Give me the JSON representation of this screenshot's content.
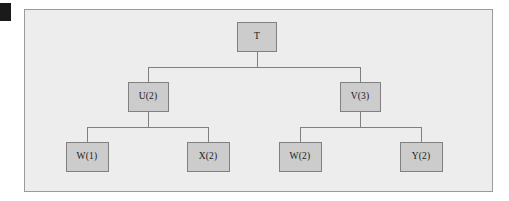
{
  "figure": {
    "name": "tree-diagram",
    "background_color": "#ffffff",
    "panel": {
      "fill_color": "#ededed",
      "border_color": "#9a9a9a",
      "x": 24,
      "y": 9,
      "width": 469,
      "height": 183
    },
    "scan_mark": {
      "color": "#1a1a1a",
      "x": 0,
      "y": 3,
      "width": 11,
      "height": 18
    },
    "node_style": {
      "fill_color": "#cccccc",
      "border_color": "#808080",
      "text_color": "#1a1a1a"
    },
    "edge_style": {
      "color": "#808080",
      "width": 1
    }
  },
  "chart_data": {
    "type": "diagram",
    "diagram_kind": "tree",
    "title": "",
    "orientation": "top-down",
    "levels": 3,
    "nodes": [
      {
        "id": "T",
        "label": "T",
        "level": 0,
        "cx": 257,
        "cy": 37,
        "w": 40,
        "h": 30,
        "parent": null
      },
      {
        "id": "U",
        "label": "U(2)",
        "level": 1,
        "cx": 148,
        "cy": 97,
        "w": 41,
        "h": 30,
        "parent": "T"
      },
      {
        "id": "V",
        "label": "V(3)",
        "level": 1,
        "cx": 360,
        "cy": 97,
        "w": 41,
        "h": 30,
        "parent": "T"
      },
      {
        "id": "W1",
        "label": "W(1)",
        "level": 2,
        "cx": 87,
        "cy": 157,
        "w": 43,
        "h": 30,
        "parent": "U"
      },
      {
        "id": "X2",
        "label": "X(2)",
        "level": 2,
        "cx": 208,
        "cy": 157,
        "w": 43,
        "h": 30,
        "parent": "U"
      },
      {
        "id": "W2",
        "label": "W(2)",
        "level": 2,
        "cx": 300,
        "cy": 157,
        "w": 43,
        "h": 30,
        "parent": "V"
      },
      {
        "id": "Y2",
        "label": "Y(2)",
        "level": 2,
        "cx": 421,
        "cy": 157,
        "w": 43,
        "h": 30,
        "parent": "V"
      }
    ],
    "edges": [
      {
        "from": "T",
        "to": "U"
      },
      {
        "from": "T",
        "to": "V"
      },
      {
        "from": "U",
        "to": "W1"
      },
      {
        "from": "U",
        "to": "X2"
      },
      {
        "from": "V",
        "to": "W2"
      },
      {
        "from": "V",
        "to": "Y2"
      }
    ]
  }
}
